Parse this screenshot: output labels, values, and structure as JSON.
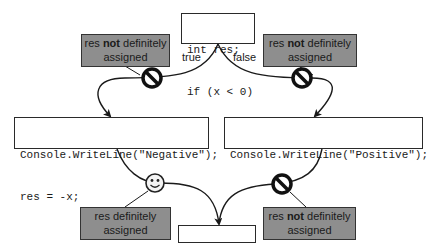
{
  "diagram": {
    "start": {
      "lines": [
        "int res;",
        "if (x < 0)"
      ]
    },
    "branches": {
      "true_label": "true",
      "false_label": "false"
    },
    "negative_block": {
      "lines": [
        "Console.WriteLine(\"Negative\");",
        "res = -x;"
      ]
    },
    "positive_block": {
      "lines": [
        "Console.WriteLine(\"Positive\");"
      ]
    },
    "return_block": {
      "lines": [
        "return res;"
      ]
    },
    "notes": {
      "top_left": {
        "pre": "res ",
        "bold": "not",
        "post": " definitely",
        "line2": "assigned",
        "icon": "prohibited-icon"
      },
      "top_right": {
        "pre": "res ",
        "bold": "not",
        "post": " definitely",
        "line2": "assigned",
        "icon": "prohibited-icon"
      },
      "bottom_left": {
        "pre": "res definitely",
        "bold": "",
        "post": "",
        "line2": "assigned",
        "icon": "smiley-icon"
      },
      "bottom_right": {
        "pre": "res ",
        "bold": "not",
        "post": " definitely",
        "line2": "assigned",
        "icon": "prohibited-icon"
      }
    },
    "colors": {
      "note_fill": "#8e8e8e",
      "stroke": "#1a1a1a",
      "code_fill": "#ffffff"
    }
  }
}
